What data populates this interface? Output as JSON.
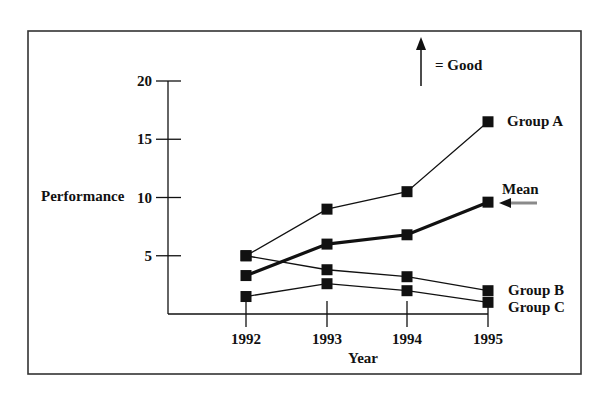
{
  "chart_data": {
    "type": "line",
    "title": "",
    "xlabel": "Year",
    "ylabel": "Performance",
    "x": [
      "1992",
      "1993",
      "1994",
      "1995"
    ],
    "yticks": [
      5,
      10,
      15,
      20
    ],
    "ylim": [
      0,
      20
    ],
    "grid": false,
    "legend_position": "inline-right",
    "series": [
      {
        "name": "Group A",
        "values": [
          5,
          9,
          10.5,
          16.5
        ],
        "emphasis": false
      },
      {
        "name": "Mean",
        "values": [
          3.3,
          6,
          6.8,
          9.6
        ],
        "emphasis": true
      },
      {
        "name": "Group B",
        "values": [
          5,
          3.8,
          3.2,
          2
        ],
        "emphasis": false
      },
      {
        "name": "Group C",
        "values": [
          1.5,
          2.6,
          2,
          1
        ],
        "emphasis": false
      }
    ],
    "annotations": [
      {
        "text": "= Good",
        "symbol": "up-arrow",
        "meaning": "higher is better"
      },
      {
        "text": "",
        "symbol": "left-arrow",
        "target": "Mean"
      }
    ]
  },
  "colors": {
    "line": "#111111",
    "marker": "#111111",
    "mean_arrow_shaft": "#8a8a8a",
    "frame": "#333333"
  }
}
